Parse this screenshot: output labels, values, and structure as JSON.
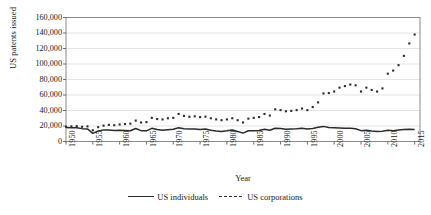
{
  "chart_data": {
    "type": "line",
    "title": "",
    "xlabel": "Year",
    "ylabel": "US patents issued",
    "xlim": [
      1950,
      2016
    ],
    "ylim": [
      0,
      160000
    ],
    "ytick_step": 20000,
    "xtick_step": 5,
    "grid": "horizontal",
    "legend_position": "bottom",
    "ytick_labels": [
      "0",
      "20,000",
      "40,000",
      "60,000",
      "80,000",
      "100,000",
      "120,000",
      "140,000",
      "160,000"
    ],
    "ytick_values": [
      0,
      20000,
      40000,
      60000,
      80000,
      100000,
      120000,
      140000,
      160000
    ],
    "xtick_labels": [
      "1950",
      "1955",
      "1960",
      "1965",
      "1970",
      "1975",
      "1980",
      "1985",
      "1990",
      "1995",
      "2000",
      "2005",
      "2010",
      "2015"
    ],
    "xtick_values": [
      1950,
      1955,
      1960,
      1965,
      1970,
      1975,
      1980,
      1985,
      1990,
      1995,
      2000,
      2005,
      2010,
      2015
    ],
    "x": [
      1950,
      1951,
      1952,
      1953,
      1954,
      1955,
      1956,
      1957,
      1958,
      1959,
      1960,
      1961,
      1962,
      1963,
      1964,
      1965,
      1966,
      1967,
      1968,
      1969,
      1970,
      1971,
      1972,
      1973,
      1974,
      1975,
      1976,
      1977,
      1978,
      1979,
      1980,
      1981,
      1982,
      1983,
      1984,
      1985,
      1986,
      1987,
      1988,
      1989,
      1990,
      1991,
      1992,
      1993,
      1994,
      1995,
      1996,
      1997,
      1998,
      1999,
      2000,
      2001,
      2002,
      2003,
      2004,
      2005,
      2006,
      2007,
      2008,
      2009,
      2010,
      2011,
      2012,
      2013,
      2014,
      2015
    ],
    "series": [
      {
        "name": "US individuals",
        "style": "solid",
        "color": "#2b2b2b",
        "values": [
          18000,
          17800,
          17600,
          16600,
          16200,
          10500,
          13500,
          15000,
          14800,
          14200,
          14500,
          14200,
          13800,
          16800,
          14000,
          13800,
          17000,
          15500,
          14500,
          15200,
          15800,
          17800,
          16500,
          16000,
          16200,
          15500,
          16000,
          14500,
          13500,
          13000,
          13800,
          14800,
          13000,
          10800,
          13800,
          14000,
          14200,
          15800,
          14500,
          17000,
          16800,
          15800,
          16200,
          16500,
          17000,
          16200,
          16800,
          18500,
          19500,
          18000,
          17800,
          17500,
          17000,
          17000,
          16500,
          14000,
          14500,
          13500,
          12800,
          13200,
          14500,
          14000,
          14800,
          15500,
          15800,
          15500
        ]
      },
      {
        "name": "US corporations",
        "style": "dotted",
        "color": "#2b2b2b",
        "values": [
          19000,
          19500,
          19800,
          19000,
          19500,
          14500,
          18500,
          20500,
          21500,
          21000,
          22000,
          22500,
          23000,
          27000,
          24500,
          25000,
          30500,
          29000,
          28500,
          30000,
          30500,
          35500,
          33000,
          32000,
          32500,
          31500,
          32000,
          30000,
          28500,
          27500,
          28500,
          30000,
          27500,
          24500,
          29500,
          30500,
          31500,
          35500,
          33500,
          41500,
          40500,
          39000,
          39500,
          40500,
          42500,
          40500,
          44500,
          50500,
          62000,
          62500,
          64500,
          69500,
          71500,
          73500,
          72500,
          64500,
          69500,
          66500,
          64500,
          68500,
          87500,
          91500,
          98500,
          110500,
          126500,
          138000
        ]
      }
    ]
  },
  "legend": {
    "items": [
      {
        "label": "US individuals",
        "style": "solid"
      },
      {
        "label": "US corporations",
        "style": "dotted"
      }
    ]
  }
}
